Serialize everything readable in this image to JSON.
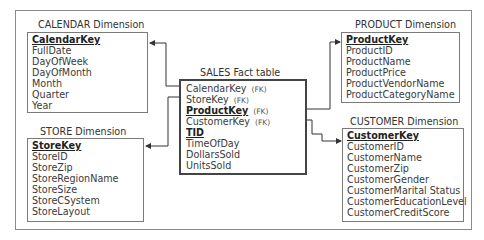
{
  "diagram": {
    "type": "star-schema",
    "fact_table": {
      "title": "SALES Fact table",
      "attributes": [
        {
          "name": "CalendarKey",
          "tag": "(FK)",
          "is_key": false
        },
        {
          "name": "StoreKey",
          "tag": "(FK)",
          "is_key": false
        },
        {
          "name": "ProductKey",
          "tag": "(FK)",
          "is_key": true
        },
        {
          "name": "CustomerKey",
          "tag": "(FK)",
          "is_key": false
        },
        {
          "name": "TID",
          "tag": "",
          "is_key": true
        },
        {
          "name": "TimeOfDay",
          "tag": "",
          "is_key": false
        },
        {
          "name": "DollarsSold",
          "tag": "",
          "is_key": false
        },
        {
          "name": "UnitsSold",
          "tag": "",
          "is_key": false
        }
      ]
    },
    "dimensions": {
      "calendar": {
        "title": "CALENDAR Dimension",
        "attributes": [
          "CalendarKey",
          "FullDate",
          "DayOfWeek",
          "DayOfMonth",
          "Month",
          "Quarter",
          "Year"
        ]
      },
      "store": {
        "title": "STORE Dimension",
        "attributes": [
          "StoreKey",
          "StoreID",
          "StoreZip",
          "StoreRegionName",
          "StoreSize",
          "StoreCSystem",
          "StoreLayout"
        ]
      },
      "product": {
        "title": "PRODUCT Dimension",
        "attributes": [
          "ProductKey",
          "ProductID",
          "ProductName",
          "ProductPrice",
          "ProductVendorName",
          "ProductCategoryName"
        ]
      },
      "customer": {
        "title": "CUSTOMER Dimension",
        "attributes": [
          "CustomerKey",
          "CustomerID",
          "CustomerName",
          "CustomerZip",
          "CustomerGender",
          "CustomerMarital Status",
          "CustomerEducationLevel",
          "CustomerCreditScore"
        ]
      }
    },
    "relationships": [
      {
        "from": "SALES.CalendarKey",
        "to": "CALENDAR.CalendarKey"
      },
      {
        "from": "SALES.StoreKey",
        "to": "STORE.StoreKey"
      },
      {
        "from": "SALES.ProductKey",
        "to": "PRODUCT.ProductKey"
      },
      {
        "from": "SALES.CustomerKey",
        "to": "CUSTOMER.CustomerKey"
      }
    ],
    "colors": {
      "line": "#333333",
      "box_border": "#7a7a7a",
      "fact_border": "#444444",
      "text": "#333333"
    }
  }
}
